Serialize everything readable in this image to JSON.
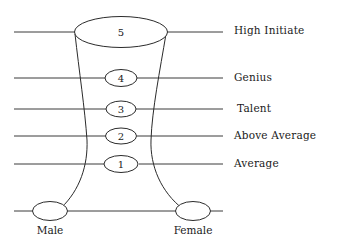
{
  "figure": {
    "background_color": "#ffffff",
    "line_color": "#2b2b2b",
    "text_color": "#1a1a1a"
  },
  "levels": [
    {
      "number": "5",
      "label": "High Initiate",
      "y": 32
    },
    {
      "number": "4",
      "label": "Genius",
      "y": 78
    },
    {
      "number": "3",
      "label": "Talent",
      "y": 109
    },
    {
      "number": "2",
      "label": "Above Average",
      "y": 136
    },
    {
      "number": "1",
      "label": "Average",
      "y": 164
    }
  ],
  "axis": {
    "male_label": "Male",
    "female_label": "Female",
    "baseline_y": 211
  }
}
